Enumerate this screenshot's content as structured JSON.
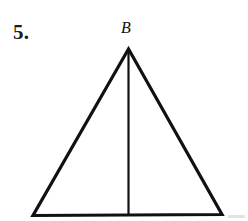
{
  "page": {
    "width": 248,
    "height": 221,
    "background_color": "#ffffff",
    "ink_color": "#111111"
  },
  "problem": {
    "number_label": "5."
  },
  "figure": {
    "kind": "isosceles-triangle-with-altitude",
    "stroke_color": "#111111",
    "triangle_stroke_width": 3.2,
    "altitude_stroke_width": 2.2,
    "vertices": {
      "apex": {
        "x": 128.5,
        "y": 49
      },
      "base_left": {
        "x": 33,
        "y": 215.5
      },
      "base_right": {
        "x": 222,
        "y": 214.5
      }
    },
    "altitude": {
      "from": {
        "x": 128.5,
        "y": 49
      },
      "to": {
        "x": 128.5,
        "y": 215
      }
    },
    "labels": [
      {
        "text": "B",
        "vertex": "apex",
        "style": "italic"
      }
    ]
  },
  "artifacts": {
    "smudge_color": "#d8d8d8"
  }
}
